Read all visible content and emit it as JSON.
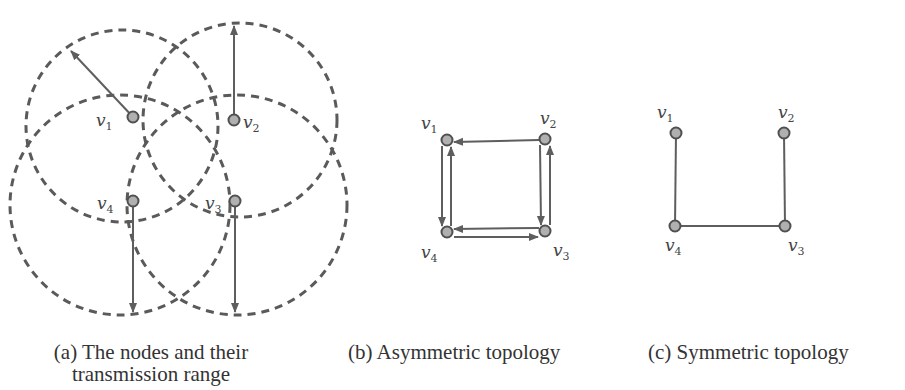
{
  "figure": {
    "panels": [
      {
        "id": "a",
        "caption_line1": "(a) The nodes and their",
        "caption_line2": "transmission range",
        "nodes": [
          {
            "label": "v",
            "sub": "1",
            "x": 133,
            "y": 117,
            "lx": 96,
            "ly": 126
          },
          {
            "label": "v",
            "sub": "2",
            "x": 234,
            "y": 120,
            "lx": 243,
            "ly": 128
          },
          {
            "label": "v",
            "sub": "3",
            "x": 235,
            "y": 201,
            "lx": 205,
            "ly": 209
          },
          {
            "label": "v",
            "sub": "4",
            "x": 133,
            "y": 201,
            "lx": 97,
            "ly": 209
          }
        ],
        "ranges": [
          {
            "node": "v1",
            "cx": 122,
            "cy": 126,
            "r": 96
          },
          {
            "node": "v2",
            "cx": 240,
            "cy": 120,
            "r": 97
          },
          {
            "node": "v3",
            "cx": 237,
            "cy": 205,
            "r": 110
          },
          {
            "node": "v4",
            "cx": 120,
            "cy": 205,
            "r": 110
          }
        ],
        "range_arrows": [
          {
            "from": "v1",
            "x1": 133,
            "y1": 117,
            "x2": 71,
            "y2": 51
          },
          {
            "from": "v2",
            "x1": 234,
            "y1": 120,
            "x2": 234,
            "y2": 26
          },
          {
            "from": "v3",
            "x1": 235,
            "y1": 201,
            "x2": 235,
            "y2": 312
          },
          {
            "from": "v4",
            "x1": 133,
            "y1": 201,
            "x2": 133,
            "y2": 312
          }
        ]
      },
      {
        "id": "b",
        "caption": "(b) Asymmetric topology",
        "nodes": [
          {
            "label": "v",
            "sub": "1",
            "x": 447,
            "y": 140,
            "lx": 421,
            "ly": 129
          },
          {
            "label": "v",
            "sub": "2",
            "x": 545,
            "y": 139,
            "lx": 540,
            "ly": 124
          },
          {
            "label": "v",
            "sub": "3",
            "x": 545,
            "y": 231,
            "lx": 553,
            "ly": 256
          },
          {
            "label": "v",
            "sub": "4",
            "x": 447,
            "y": 232,
            "lx": 421,
            "ly": 258
          }
        ],
        "edges": [
          {
            "from": "v2",
            "to": "v1",
            "x1": 539,
            "y1": 140,
            "x2": 454,
            "y2": 142
          },
          {
            "from": "v1",
            "to": "v4",
            "x1": 442,
            "y1": 146,
            "x2": 442,
            "y2": 226
          },
          {
            "from": "v4",
            "to": "v1",
            "x1": 451,
            "y1": 226,
            "x2": 451,
            "y2": 147
          },
          {
            "from": "v2",
            "to": "v3",
            "x1": 540,
            "y1": 145,
            "x2": 541,
            "y2": 225
          },
          {
            "from": "v3",
            "to": "v2",
            "x1": 550,
            "y1": 225,
            "x2": 550,
            "y2": 146
          },
          {
            "from": "v3",
            "to": "v4",
            "x1": 539,
            "y1": 228,
            "x2": 454,
            "y2": 229
          },
          {
            "from": "v4",
            "to": "v3",
            "x1": 454,
            "y1": 237,
            "x2": 538,
            "y2": 237
          }
        ]
      },
      {
        "id": "c",
        "caption": "(c) Symmetric topology",
        "nodes": [
          {
            "label": "v",
            "sub": "1",
            "x": 676,
            "y": 133,
            "lx": 657,
            "ly": 118
          },
          {
            "label": "v",
            "sub": "2",
            "x": 784,
            "y": 133,
            "lx": 778,
            "ly": 118
          },
          {
            "label": "v",
            "sub": "3",
            "x": 785,
            "y": 226,
            "lx": 788,
            "ly": 251
          },
          {
            "label": "v",
            "sub": "4",
            "x": 675,
            "y": 226,
            "lx": 665,
            "ly": 251
          }
        ],
        "edges": [
          {
            "from": "v1",
            "to": "v4",
            "x1": 676,
            "y1": 133,
            "x2": 675,
            "y2": 226
          },
          {
            "from": "v2",
            "to": "v3",
            "x1": 784,
            "y1": 133,
            "x2": 785,
            "y2": 226
          },
          {
            "from": "v4",
            "to": "v3",
            "x1": 675,
            "y1": 226,
            "x2": 785,
            "y2": 226
          }
        ]
      }
    ],
    "colors": {
      "stroke": "#5a5a5a",
      "node_fill": "#b0b0b0",
      "node_stroke": "#505050",
      "text": "#333333"
    }
  }
}
